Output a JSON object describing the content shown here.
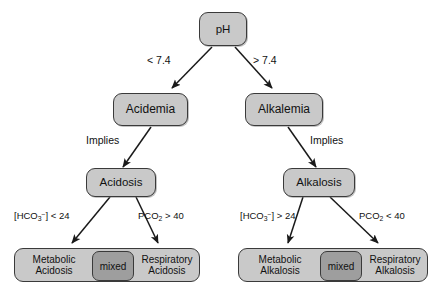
{
  "diagram": {
    "colors": {
      "node_fill": "#c9c9c9",
      "mixed_fill": "#9e9e9e",
      "border": "#3a3a3a",
      "background": "#ffffff",
      "text": "#111111"
    },
    "root": {
      "label": "pH"
    },
    "branches": {
      "left": {
        "condition_label": "< 7.4",
        "level2": {
          "label": "Acidemia"
        },
        "implies_label": "Implies",
        "level3": {
          "label": "Acidosis"
        },
        "outcome_left_condition": "[HCO3-] < 24",
        "outcome_right_condition": "PCO2 > 40",
        "outcome": {
          "left_line1": "Metabolic",
          "left_line2": "Acidosis",
          "middle": "mixed",
          "right_line1": "Respiratory",
          "right_line2": "Acidosis"
        }
      },
      "right": {
        "condition_label": "> 7.4",
        "level2": {
          "label": "Alkalemia"
        },
        "implies_label": "Implies",
        "level3": {
          "label": "Alkalosis"
        },
        "outcome_left_condition": "[HCO3-] > 24",
        "outcome_right_condition": "PCO2 < 40",
        "outcome": {
          "left_line1": "Metabolic",
          "left_line2": "Alkalosis",
          "middle": "mixed",
          "right_line1": "Respiratory",
          "right_line2": "Alkalosis"
        }
      }
    }
  }
}
